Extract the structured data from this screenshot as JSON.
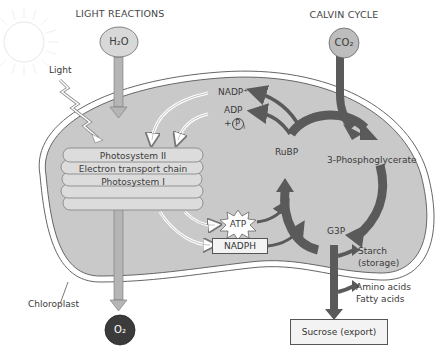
{
  "headers": {
    "light_reactions": "LIGHT REACTIONS",
    "calvin_cycle": "CALVIN CYCLE"
  },
  "inputs": {
    "water": "H₂O",
    "carbon_dioxide": "CO₂",
    "light": "Light"
  },
  "outputs": {
    "oxygen": "O₂",
    "sucrose": "Sucrose (export)",
    "starch_line1": "Starch",
    "starch_line2": "(storage)",
    "amino_acids": "Amino acids",
    "fatty_acids": "Fatty acids"
  },
  "thylakoid": {
    "line1": "Photosystem II",
    "line2": "Electron transport chain",
    "line3": "Photosystem I"
  },
  "carriers": {
    "nadp": "NADP⁺",
    "adp": "ADP",
    "pi_prefix": "+",
    "pi": "P",
    "pi_sub": "i",
    "atp": "ATP",
    "nadph": "NADPH"
  },
  "calvin": {
    "rubp": "RuBP",
    "pga": "3-Phosphoglycerate",
    "g3p": "G3P"
  },
  "organelle_label": "Chloroplast",
  "colors": {
    "stroma": "#c9c9c9",
    "membrane": "#ffffff",
    "outline": "#555555",
    "light_arrow": "#b5b5b5",
    "calvin_arrow": "#5a5a5a",
    "oxygen": "#3b3b3b",
    "co2": "#bdbdbd",
    "h2o": "#d8d8d8"
  }
}
